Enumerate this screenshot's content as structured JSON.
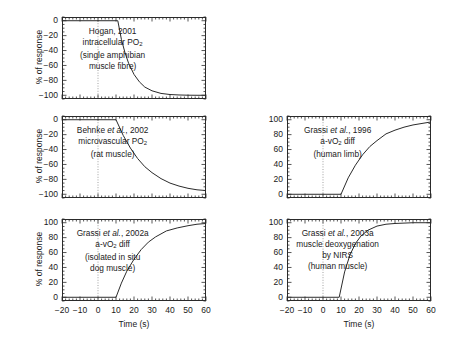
{
  "figure": {
    "background": "#ffffff",
    "axis_color": "#2b2b2b",
    "curve_color": "#2b2b2b",
    "zeroline_color": "#7a7a7a"
  },
  "axes": {
    "x_label": "Time (s)",
    "x_ticks": [
      "-20",
      "-10",
      "0",
      "10",
      "20",
      "30",
      "40",
      "50",
      "60"
    ],
    "x_tick_values": [
      -20,
      -10,
      0,
      10,
      20,
      30,
      40,
      50,
      60
    ],
    "x_minor_step": 2,
    "x_range": [
      -20,
      60
    ],
    "y_label_negative": "% of response",
    "y_ticks_negative": [
      "0",
      "-20",
      "-40",
      "-60",
      "-80",
      "-100"
    ],
    "y_tick_values_negative": [
      0,
      -20,
      -40,
      -60,
      -80,
      -100
    ],
    "y_range_negative": [
      -105,
      5
    ],
    "y_label_positive": "% of response",
    "y_ticks_positive": [
      "100",
      "80",
      "60",
      "40",
      "20",
      "0"
    ],
    "y_tick_values_positive": [
      100,
      80,
      60,
      40,
      20,
      0
    ],
    "y_range_positive": [
      -5,
      105
    ],
    "y_minor_step": 5
  },
  "chart_data": {
    "type": "line",
    "title": "",
    "xlabel": "Time (s)",
    "ylabel": "% of response",
    "xlim": [
      -20,
      60
    ],
    "grid": false,
    "legend": "none",
    "panels": [
      {
        "id": "hogan-2001",
        "position": "top-left",
        "annotation_lines": [
          "Hogan, 2001",
          "intracellular PO2",
          "(single amphibian",
          "muscle fibre)"
        ],
        "citation": "Hogan, 2001",
        "measure": "intracellular PO2",
        "preparation": "(single amphibian muscle fibre)",
        "direction": "decreasing",
        "ylim": [
          -105,
          5
        ],
        "yticks": [
          0,
          -20,
          -40,
          -60,
          -80,
          -100
        ],
        "baseline": 0,
        "amplitude": -100,
        "time_delay": 11,
        "tau": 7,
        "x": [
          -20,
          -10,
          0,
          5,
          11,
          13,
          15,
          17,
          20,
          23,
          26,
          30,
          35,
          40,
          45,
          50,
          55,
          60
        ],
        "y": [
          0,
          0,
          0,
          0,
          0,
          -25,
          -43,
          -57,
          -72,
          -82,
          -89,
          -94,
          -97.5,
          -99,
          -99.6,
          -99.9,
          -100,
          -100
        ]
      },
      {
        "id": "grassi-1996",
        "position": "middle-right",
        "annotation_lines": [
          "Grassi et al., 1996",
          "a-vO2 diff",
          "(human limb)"
        ],
        "citation": "Grassi et al., 1996",
        "measure": "a-vO2 diff",
        "preparation": "(human limb)",
        "direction": "increasing",
        "ylim": [
          -5,
          105
        ],
        "yticks": [
          100,
          80,
          60,
          40,
          20,
          0
        ],
        "baseline": 0,
        "amplitude": 100,
        "time_delay": 10,
        "tau": 16,
        "x": [
          -20,
          -10,
          0,
          5,
          10,
          14,
          18,
          22,
          26,
          30,
          35,
          40,
          45,
          50,
          55,
          60
        ],
        "y": [
          0,
          0,
          0,
          0,
          0,
          22,
          39,
          53,
          64,
          72,
          81,
          86,
          90,
          93,
          95,
          97
        ]
      },
      {
        "id": "behnke-2002",
        "position": "middle-left",
        "annotation_lines": [
          "Behnke et al., 2002",
          "microvascular PO2",
          "(rat muscle)"
        ],
        "citation": "Behnke et al., 2002",
        "measure": "microvascular PO2",
        "preparation": "(rat muscle)",
        "direction": "decreasing",
        "ylim": [
          -105,
          5
        ],
        "yticks": [
          0,
          -20,
          -40,
          -60,
          -80,
          -100
        ],
        "baseline": 0,
        "amplitude": -100,
        "time_delay": 10,
        "tau": 17,
        "x": [
          -20,
          -10,
          0,
          5,
          10,
          14,
          18,
          22,
          26,
          30,
          35,
          40,
          45,
          50,
          55,
          60
        ],
        "y": [
          0,
          0,
          0,
          0,
          0,
          -21,
          -38,
          -52,
          -63,
          -71,
          -79,
          -85,
          -89,
          -92,
          -94,
          -95
        ]
      },
      {
        "id": "grassi-2002a",
        "position": "bottom-left",
        "annotation_lines": [
          "Grassi et al., 2002a",
          "a-vO2 diff",
          "(isolated in situ",
          "dog muscle)"
        ],
        "citation": "Grassi et al., 2002a",
        "measure": "a-vO2 diff",
        "preparation": "(isolated in situ dog muscle)",
        "direction": "increasing",
        "ylim": [
          -5,
          105
        ],
        "yticks": [
          100,
          80,
          60,
          40,
          20,
          0
        ],
        "baseline": 0,
        "amplitude": 100,
        "time_delay": 10,
        "tau": 14,
        "x": [
          -20,
          -10,
          0,
          5,
          10,
          13,
          16,
          20,
          24,
          28,
          32,
          38,
          44,
          50,
          55,
          60
        ],
        "y": [
          0,
          0,
          0,
          0,
          0,
          19,
          35,
          51,
          64,
          74,
          81,
          89,
          93,
          96,
          98,
          99
        ]
      },
      {
        "id": "grassi-2003a",
        "position": "bottom-right",
        "annotation_lines": [
          "Grassi et al., 2003a",
          "muscle deoxygenation",
          "by NIRS",
          "(human muscle)"
        ],
        "citation": "Grassi et al., 2003a",
        "measure": "muscle deoxygenation by NIRS",
        "preparation": "(human muscle)",
        "direction": "increasing",
        "ylim": [
          -5,
          105
        ],
        "yticks": [
          100,
          80,
          60,
          40,
          20,
          0
        ],
        "baseline": 0,
        "amplitude": 100,
        "time_delay": 9,
        "tau": 7,
        "x": [
          -20,
          -10,
          0,
          5,
          9,
          12,
          15,
          18,
          21,
          25,
          30,
          35,
          40,
          45,
          50,
          55,
          60
        ],
        "y": [
          0,
          0,
          0,
          0,
          0,
          34,
          57,
          72,
          82,
          90,
          95.5,
          98,
          99,
          99.5,
          100,
          100,
          100
        ]
      }
    ]
  }
}
